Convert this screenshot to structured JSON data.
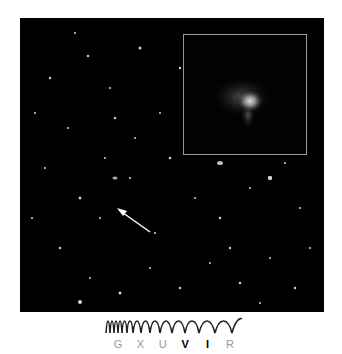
{
  "image": {
    "description": "Deep field of distant galaxies with inset zoom of a faint galaxy",
    "arrow_target": "faint galaxy",
    "colors": {
      "background": "#000000",
      "inset_border": "#9a9a9a"
    }
  },
  "legend": {
    "bands": [
      {
        "label": "G",
        "active": false
      },
      {
        "label": "X",
        "active": false
      },
      {
        "label": "U",
        "active": false
      },
      {
        "label": "V",
        "active": true
      },
      {
        "label": "I",
        "active": true
      },
      {
        "label": "R",
        "active": false
      }
    ]
  }
}
